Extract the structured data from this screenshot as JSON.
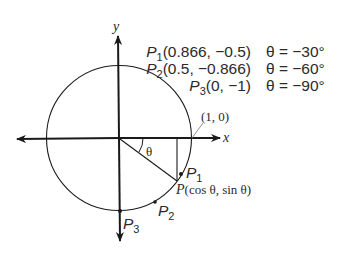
{
  "diagram": {
    "axes": {
      "x_label": "x",
      "y_label": "y"
    },
    "reference_point_label": "(1, 0)",
    "angle_label": "θ",
    "point_p_label": "P",
    "point_p_coords": "(cos θ, sin θ)",
    "points": [
      {
        "name": "P",
        "sub": "1",
        "coords": "(0.866, −0.5)",
        "angle": "θ = −30°"
      },
      {
        "name": "P",
        "sub": "2",
        "coords": "(0.5, −0.866)",
        "angle": "θ = −60°"
      },
      {
        "name": "P",
        "sub": "3",
        "coords": "(0, −1)",
        "angle": "θ = −90°"
      }
    ],
    "colors": {
      "stroke": "#1a1a1a",
      "text": "#2a2a2a",
      "background": "#ffffff"
    }
  }
}
